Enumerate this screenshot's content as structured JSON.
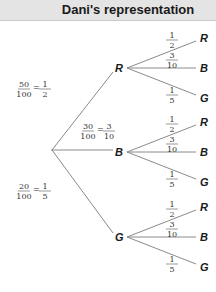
{
  "header": {
    "title": "Dani's representation"
  },
  "tree": {
    "root": {
      "x": 52,
      "y": 150
    },
    "level1": [
      {
        "label": "R",
        "x": 119,
        "y": 68,
        "prob_text": [
          "50",
          "100",
          "1",
          "2"
        ],
        "label_pos": [
          16,
          88
        ]
      },
      {
        "label": "B",
        "x": 119,
        "y": 152,
        "prob_text": [
          "30",
          "100",
          "3",
          "10"
        ],
        "label_pos": [
          80,
          130
        ]
      },
      {
        "label": "G",
        "x": 119,
        "y": 237,
        "prob_text": [
          "20",
          "100",
          "1",
          "5"
        ],
        "label_pos": [
          16,
          190
        ]
      }
    ],
    "leaves": [
      {
        "label": "R",
        "prob_num": "1",
        "prob_den": "2"
      },
      {
        "label": "B",
        "prob_num": "3",
        "prob_den": "10"
      },
      {
        "label": "G",
        "prob_num": "1",
        "prob_den": "5"
      }
    ]
  },
  "colors": {
    "line": "#8a8a8a",
    "header_bg": "#e4e4e4"
  }
}
